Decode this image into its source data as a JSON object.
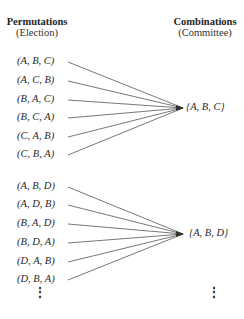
{
  "headers": {
    "left": {
      "title": "Permutations",
      "subtitle": "(Election)"
    },
    "right": {
      "title": "Combinations",
      "subtitle": "(Committee)"
    }
  },
  "groups": [
    {
      "permutations": [
        "(A, B, C)",
        "(A, C, B)",
        "(B, A, C)",
        "(B, C, A)",
        "(C, A, B)",
        "(C, B, A)"
      ],
      "combination": "{A, B, C}"
    },
    {
      "permutations": [
        "(A, B, D)",
        "(A, D, B)",
        "(B, A, D)",
        "(B, D, A)",
        "(D, A, B)",
        "(D, B, A)"
      ],
      "combination": "{A, B, D}"
    }
  ],
  "continuation": {
    "left": "⋮",
    "right": "⋮"
  },
  "colors": {
    "line": "#555555",
    "text": "#2a2a2a"
  }
}
